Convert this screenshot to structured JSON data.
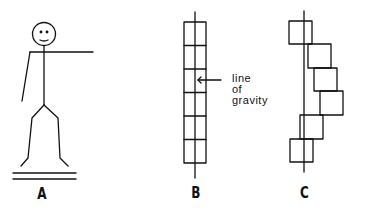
{
  "figure": {
    "panels": [
      {
        "id": "A",
        "label": "A",
        "description": "stick figure standing with one arm extended horizontally"
      },
      {
        "id": "B",
        "label": "B",
        "description": "aligned stack of six blocks centered on line of gravity"
      },
      {
        "id": "C",
        "label": "C",
        "description": "misaligned stack of six blocks offset from line of gravity"
      }
    ],
    "annotation": {
      "lines": [
        "line",
        "of",
        "gravity"
      ]
    },
    "colors": {
      "ink": "#111111",
      "background": "#ffffff"
    }
  }
}
